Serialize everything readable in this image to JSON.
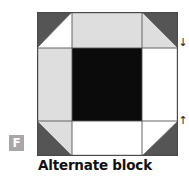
{
  "diagram": {
    "caption": "Alternate block",
    "badge_label": "F",
    "arrows": {
      "top": "↓",
      "bottom": "↑"
    },
    "colors": {
      "dark": "#555555",
      "black": "#0b0b0b",
      "light": "#dedede",
      "white": "#ffffff",
      "line": "#555555",
      "badge": "#a7a7a7"
    },
    "grid": {
      "cols": [
        0,
        35,
        105,
        141
      ],
      "rows": [
        0,
        36,
        109,
        144
      ]
    },
    "panels": {
      "top": "light",
      "left": "light",
      "right": "white",
      "bottom": "white",
      "center": "black"
    },
    "corners": {
      "top_left": {
        "dark_triangle": "upper-left",
        "other": "white"
      },
      "top_right": {
        "dark_triangle": "upper-right",
        "other": "light"
      },
      "bottom_left": {
        "dark_triangle": "lower-left",
        "other": "light"
      },
      "bottom_right": {
        "dark_triangle": "lower-right",
        "other": "white"
      }
    }
  }
}
